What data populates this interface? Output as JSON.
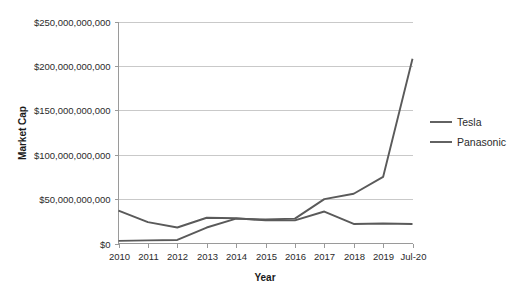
{
  "chart_data": {
    "type": "line",
    "title": "",
    "xlabel": "Year",
    "ylabel": "Market Cap",
    "categories": [
      "2010",
      "2011",
      "2012",
      "2013",
      "2014",
      "2015",
      "2016",
      "2017",
      "2018",
      "2019",
      "Jul-20"
    ],
    "series": [
      {
        "name": "Tesla",
        "color": "#5a5a5a",
        "values": [
          3000000000,
          3500000000,
          4000000000,
          18000000000,
          28000000000,
          27000000000,
          28000000000,
          50000000000,
          56000000000,
          75000000000,
          208000000000
        ]
      },
      {
        "name": "Panasonic",
        "color": "#5a5a5a",
        "values": [
          37000000000,
          24000000000,
          18000000000,
          29000000000,
          28500000000,
          26000000000,
          26000000000,
          36000000000,
          22000000000,
          22500000000,
          22000000000
        ]
      }
    ],
    "ylim": [
      0,
      250000000000
    ],
    "ytick_values": [
      0,
      50000000000,
      100000000000,
      150000000000,
      200000000000,
      250000000000
    ],
    "ytick_labels": [
      "$0",
      "$50,000,000,000",
      "$100,000,000,000",
      "$150,000,000,000",
      "$200,000,000,000",
      "$250,000,000,000"
    ],
    "grid": true,
    "legend_position": "right",
    "legend_entries": [
      "Tesla",
      "Panasonic"
    ],
    "background_color": "#ffffff",
    "gridline_color": "#c9c9c9",
    "axis_color": "#9a9a9a"
  }
}
